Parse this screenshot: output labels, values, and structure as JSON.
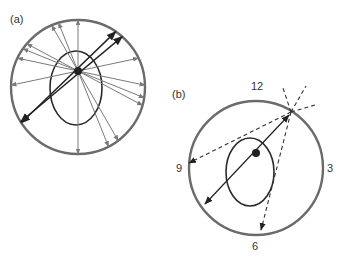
{
  "panels": {
    "a": {
      "label": "(a)"
    },
    "b": {
      "label": "(b)",
      "clock_labels": {
        "top": "12",
        "right": "3",
        "bottom": "6",
        "left": "9"
      }
    }
  },
  "colors": {
    "outer_circle": "#6b6b6b",
    "ellipse": "#2a2a2a",
    "gray_arrow": "#7a7a7a",
    "dark_arrow": "#222222"
  }
}
